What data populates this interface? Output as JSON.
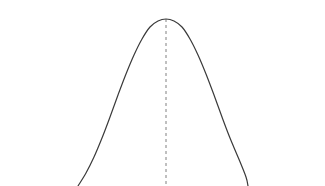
{
  "figure": {
    "title": "",
    "background_color": "#ffffff",
    "width": 325,
    "height": 186
  },
  "chart_data": {
    "type": "line",
    "title": "",
    "subtitle": "",
    "xlabel": "",
    "ylabel": "",
    "legend": [],
    "annotations": [],
    "grid": false,
    "axes_visible": false,
    "tick_labels_x": [],
    "tick_labels_y": [],
    "distribution": {
      "kind": "normal",
      "mean_px_x": 166,
      "peak_px_y": 19,
      "std_dev_px": 36,
      "left_tail_exit_px_x": 78,
      "right_tail_exit_px_x": 248,
      "baseline_px_y": 186
    },
    "series": [
      {
        "name": "normal-density-curve",
        "color": "#3a3a3a",
        "line_width": 1.2,
        "line_style": "solid",
        "x": [
          78,
          86,
          94,
          102,
          110,
          118,
          126,
          134,
          142,
          150,
          158,
          166,
          174,
          182,
          190,
          198,
          206,
          214,
          222,
          230,
          238,
          246,
          248
        ],
        "y": [
          186,
          173,
          157,
          138,
          117,
          95,
          74,
          55,
          39,
          27,
          21,
          19,
          21,
          27,
          39,
          55,
          74,
          95,
          117,
          138,
          157,
          177,
          186
        ]
      }
    ],
    "reference_lines": [
      {
        "name": "mean-line",
        "orientation": "vertical",
        "x": 166,
        "y_from": 19,
        "y_to": 186,
        "color": "#808080",
        "line_style": "dashed",
        "dash_pattern": "3,3",
        "line_width": 1
      }
    ],
    "xlim": [
      0,
      325
    ],
    "ylim": [
      0,
      186
    ]
  }
}
